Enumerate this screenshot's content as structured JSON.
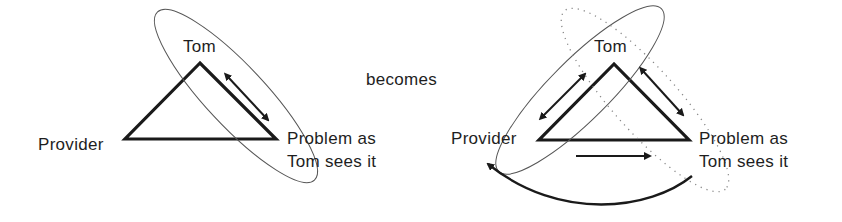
{
  "diagram": {
    "connector_label": "becomes",
    "left": {
      "name": "before",
      "nodes": {
        "top": "Tom",
        "left": "Provider",
        "right_line1": "Problem as",
        "right_line2": "Tom sees it"
      },
      "edges": [
        {
          "from": "Tom",
          "to": "Problem as Tom sees it",
          "type": "double-arrow"
        }
      ],
      "groupings": [
        {
          "style": "solid-ellipse",
          "encloses": [
            "Tom",
            "Problem as Tom sees it"
          ]
        }
      ]
    },
    "right": {
      "name": "after",
      "nodes": {
        "top": "Tom",
        "left": "Provider",
        "right_line1": "Problem as",
        "right_line2": "Tom sees it"
      },
      "edges": [
        {
          "from": "Provider",
          "to": "Tom",
          "type": "double-arrow"
        },
        {
          "from": "Tom",
          "to": "Problem as Tom sees it",
          "type": "double-arrow"
        },
        {
          "from": "Provider",
          "to": "Problem as Tom sees it",
          "type": "arrow"
        },
        {
          "from": "Problem as Tom sees it",
          "to": "Provider",
          "type": "curved-arrow"
        }
      ],
      "groupings": [
        {
          "style": "solid-ellipse",
          "encloses": [
            "Provider",
            "Tom"
          ]
        },
        {
          "style": "dotted-ellipse",
          "encloses": [
            "Tom",
            "Problem as Tom sees it"
          ]
        }
      ]
    },
    "colors": {
      "stroke": "#1a1a1a",
      "ellipse": "#555555",
      "dots": "#888888",
      "text": "#1e1e1e"
    }
  }
}
